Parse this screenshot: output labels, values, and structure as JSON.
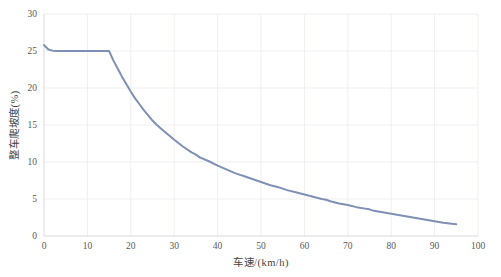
{
  "chart": {
    "title": "",
    "ylabel": "整车爬坡度(%)",
    "xlabel": "车速/(km/h)"
  },
  "chart_data": {
    "type": "line",
    "title": "",
    "xlabel": "车速/(km/h)",
    "ylabel": "整车爬坡度(%)",
    "xlim": [
      0,
      100
    ],
    "ylim": [
      0,
      30
    ],
    "xticks": [
      0,
      10,
      20,
      30,
      40,
      50,
      60,
      70,
      80,
      90,
      100
    ],
    "yticks": [
      0,
      5,
      10,
      15,
      20,
      25,
      30
    ],
    "grid": true,
    "legend": "none",
    "series": [
      {
        "name": "整车爬坡度",
        "points": [
          [
            0,
            25.8
          ],
          [
            0.5,
            25.5
          ],
          [
            1,
            25.2
          ],
          [
            2,
            25.05
          ],
          [
            3,
            25.0
          ],
          [
            5,
            25.0
          ],
          [
            8,
            25.0
          ],
          [
            10,
            25.0
          ],
          [
            12,
            25.0
          ],
          [
            14,
            25.0
          ],
          [
            15,
            25.0
          ],
          [
            16,
            23.7
          ],
          [
            17,
            22.6
          ],
          [
            18,
            21.5
          ],
          [
            19,
            20.5
          ],
          [
            20,
            19.5
          ],
          [
            21,
            18.6
          ],
          [
            22,
            17.8
          ],
          [
            23,
            17.0
          ],
          [
            24,
            16.3
          ],
          [
            25,
            15.6
          ],
          [
            26,
            15.0
          ],
          [
            27,
            14.5
          ],
          [
            28,
            14.0
          ],
          [
            29,
            13.5
          ],
          [
            30,
            13.0
          ],
          [
            32,
            12.1
          ],
          [
            34,
            11.3
          ],
          [
            35,
            11.0
          ],
          [
            36,
            10.6
          ],
          [
            38,
            10.1
          ],
          [
            40,
            9.5
          ],
          [
            42,
            9.0
          ],
          [
            44,
            8.5
          ],
          [
            45,
            8.3
          ],
          [
            46,
            8.1
          ],
          [
            48,
            7.7
          ],
          [
            50,
            7.3
          ],
          [
            52,
            6.9
          ],
          [
            54,
            6.6
          ],
          [
            55,
            6.4
          ],
          [
            56,
            6.2
          ],
          [
            58,
            5.9
          ],
          [
            60,
            5.6
          ],
          [
            62,
            5.3
          ],
          [
            64,
            5.0
          ],
          [
            65,
            4.9
          ],
          [
            66,
            4.7
          ],
          [
            68,
            4.4
          ],
          [
            70,
            4.2
          ],
          [
            72,
            3.9
          ],
          [
            74,
            3.7
          ],
          [
            75,
            3.6
          ],
          [
            76,
            3.4
          ],
          [
            78,
            3.2
          ],
          [
            80,
            3.0
          ],
          [
            82,
            2.8
          ],
          [
            84,
            2.6
          ],
          [
            85,
            2.5
          ],
          [
            86,
            2.4
          ],
          [
            88,
            2.2
          ],
          [
            90,
            2.0
          ],
          [
            92,
            1.8
          ],
          [
            94,
            1.65
          ],
          [
            95,
            1.6
          ]
        ]
      }
    ]
  },
  "colors": {
    "line": "#7e90b4",
    "grid": "#f0efee",
    "axis": "#d9d9d9",
    "tick_text": "#595959",
    "title_text": "#3f3f3f"
  }
}
